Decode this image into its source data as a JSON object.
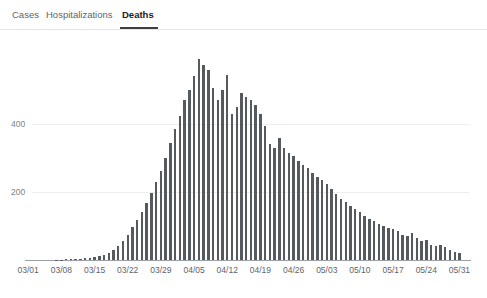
{
  "tabs": {
    "items": [
      {
        "label": "Cases",
        "active": false
      },
      {
        "label": "Hospitalizations",
        "active": false
      },
      {
        "label": "Deaths",
        "active": true
      }
    ]
  },
  "caption": {
    "text": ""
  },
  "chart_data": {
    "type": "bar",
    "title": "",
    "xlabel": "",
    "ylabel": "",
    "ylim": [
      0,
      620
    ],
    "grid": true,
    "legend": null,
    "bar_color": "#555a5e",
    "axis_color": "#9aa0a6",
    "grid_color": "#eceded",
    "yticks": [
      200,
      400
    ],
    "ytick_labels": [
      "200",
      "400"
    ],
    "xtick_labels": [
      "03/01",
      "03/08",
      "03/15",
      "03/22",
      "03/29",
      "04/05",
      "04/12",
      "04/19",
      "04/26",
      "05/03",
      "05/10",
      "05/17",
      "05/24",
      "05/31"
    ],
    "xtick_indices": [
      0,
      7,
      14,
      21,
      28,
      35,
      42,
      49,
      56,
      63,
      70,
      77,
      84,
      91
    ],
    "categories": [
      "03/01",
      "03/02",
      "03/03",
      "03/04",
      "03/05",
      "03/06",
      "03/07",
      "03/08",
      "03/09",
      "03/10",
      "03/11",
      "03/12",
      "03/13",
      "03/14",
      "03/15",
      "03/16",
      "03/17",
      "03/18",
      "03/19",
      "03/20",
      "03/21",
      "03/22",
      "03/23",
      "03/24",
      "03/25",
      "03/26",
      "03/27",
      "03/28",
      "03/29",
      "03/30",
      "03/31",
      "04/01",
      "04/02",
      "04/03",
      "04/04",
      "04/05",
      "04/06",
      "04/07",
      "04/08",
      "04/09",
      "04/10",
      "04/11",
      "04/12",
      "04/13",
      "04/14",
      "04/15",
      "04/16",
      "04/17",
      "04/18",
      "04/19",
      "04/20",
      "04/21",
      "04/22",
      "04/23",
      "04/24",
      "04/25",
      "04/26",
      "04/27",
      "04/28",
      "04/29",
      "04/30",
      "05/01",
      "05/02",
      "05/03",
      "05/04",
      "05/05",
      "05/06",
      "05/07",
      "05/08",
      "05/09",
      "05/10",
      "05/11",
      "05/12",
      "05/13",
      "05/14",
      "05/15",
      "05/16",
      "05/17",
      "05/18",
      "05/19",
      "05/20",
      "05/21",
      "05/22",
      "05/23",
      "05/24",
      "05/25",
      "05/26",
      "05/27",
      "05/28",
      "05/29",
      "05/30",
      "05/31"
    ],
    "values": [
      0,
      0,
      0,
      0,
      0,
      0,
      1,
      1,
      2,
      2,
      3,
      4,
      5,
      7,
      9,
      12,
      16,
      22,
      30,
      42,
      55,
      74,
      96,
      118,
      142,
      168,
      196,
      228,
      262,
      300,
      345,
      385,
      425,
      470,
      500,
      540,
      590,
      575,
      560,
      505,
      470,
      500,
      545,
      430,
      450,
      490,
      480,
      470,
      455,
      430,
      395,
      340,
      330,
      360,
      330,
      315,
      305,
      290,
      280,
      270,
      255,
      245,
      235,
      225,
      210,
      195,
      180,
      170,
      160,
      150,
      140,
      130,
      120,
      115,
      105,
      100,
      95,
      90,
      85,
      75,
      70,
      80,
      65,
      55,
      60,
      45,
      40,
      45,
      38,
      30,
      25,
      20
    ]
  }
}
